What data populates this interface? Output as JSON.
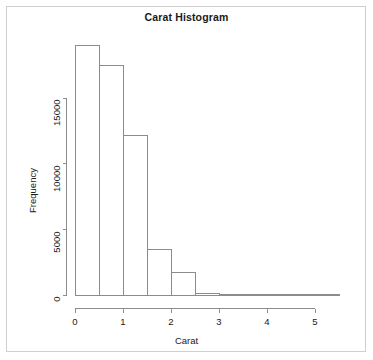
{
  "chart_data": {
    "type": "bar",
    "title": "Carat Histogram",
    "xlabel": "Carat",
    "ylabel": "Frequency",
    "grid": false,
    "legend": false,
    "bin_width": 0.5,
    "categories": [
      "0-0.5",
      "0.5-1",
      "1-1.5",
      "1.5-2",
      "2-2.5",
      "2.5-3",
      "3-3.5",
      "3.5-4",
      "4-4.5",
      "4.5-5",
      "5-5.5"
    ],
    "bin_edges": [
      0,
      0.5,
      1,
      1.5,
      2,
      2.5,
      3,
      3.5,
      4,
      4.5,
      5,
      5.5
    ],
    "values": [
      19000,
      17440,
      12180,
      3500,
      1700,
      130,
      20,
      8,
      3,
      1,
      1
    ],
    "xlim": [
      0,
      5.5
    ],
    "ylim": [
      0,
      19000
    ],
    "xticks": [
      0,
      1,
      2,
      3,
      4,
      5
    ],
    "xtick_labels": [
      "0",
      "1",
      "2",
      "3",
      "4",
      "5"
    ],
    "yticks": [
      0,
      5000,
      10000,
      15000
    ],
    "ytick_labels": [
      "0",
      "5000",
      "10000",
      "15000"
    ],
    "bar_fill": "#ffffff",
    "bar_stroke": "#8c8c8c",
    "axis_color": "#8c8c8c",
    "text_color": "#1a1a1a"
  }
}
